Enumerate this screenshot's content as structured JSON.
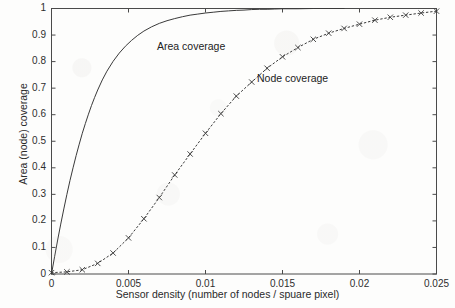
{
  "chart_data": {
    "type": "line",
    "title": "",
    "xlabel": "Sensor density (number of nodes / spuare pixel)",
    "ylabel": "Area (node) coverage",
    "xlim": [
      0,
      0.025
    ],
    "ylim": [
      0,
      1
    ],
    "grid": false,
    "legend_position": "inline-annotations",
    "xticks": [
      0,
      0.005,
      0.01,
      0.015,
      0.02,
      0.025
    ],
    "xtick_labels": [
      "0",
      "0.005",
      "0.01",
      "0.015",
      "0.02",
      "0.025"
    ],
    "yticks": [
      0,
      0.1,
      0.2,
      0.3,
      0.4,
      0.5,
      0.6,
      0.7,
      0.8,
      0.9,
      1
    ],
    "ytick_labels": [
      "0",
      "0.1",
      "0.2",
      "0.3",
      "0.4",
      "0.5",
      "0.6",
      "0.7",
      "0.8",
      "0.9",
      "1"
    ],
    "annotations": [
      {
        "text": "Area coverage",
        "x": 0.0068,
        "y": 0.845
      },
      {
        "text": "Node coverage",
        "x": 0.0133,
        "y": 0.735
      }
    ],
    "series": [
      {
        "name": "Area coverage",
        "style": "solid",
        "marker": "none",
        "color": "#3a3a3a",
        "x": [
          0,
          0.0002,
          0.0004,
          0.0006,
          0.0008,
          0.001,
          0.0012,
          0.0014,
          0.0016,
          0.0018,
          0.002,
          0.0022,
          0.0024,
          0.0026,
          0.0028,
          0.003,
          0.0033,
          0.0036,
          0.004,
          0.0044,
          0.0048,
          0.0052,
          0.0056,
          0.006,
          0.0065,
          0.007,
          0.0075,
          0.008,
          0.0085,
          0.009,
          0.0095,
          0.01,
          0.0105,
          0.011,
          0.0115,
          0.012,
          0.0125,
          0.013,
          0.0135,
          0.014,
          0.0145,
          0.015,
          0.016,
          0.017,
          0.018,
          0.019
        ],
        "y": [
          0,
          0.065,
          0.128,
          0.188,
          0.245,
          0.3,
          0.352,
          0.4,
          0.446,
          0.489,
          0.53,
          0.567,
          0.602,
          0.635,
          0.665,
          0.693,
          0.731,
          0.764,
          0.801,
          0.832,
          0.858,
          0.88,
          0.899,
          0.915,
          0.931,
          0.944,
          0.954,
          0.962,
          0.969,
          0.975,
          0.979,
          0.983,
          0.986,
          0.989,
          0.991,
          0.993,
          0.994,
          0.996,
          0.997,
          0.997,
          0.998,
          0.999,
          0.999,
          1.0,
          1.0,
          1.0
        ]
      },
      {
        "name": "Node coverage",
        "style": "dotted",
        "marker": "x",
        "color": "#3a3a3a",
        "x": [
          0,
          0.001,
          0.002,
          0.003,
          0.004,
          0.005,
          0.006,
          0.007,
          0.008,
          0.009,
          0.01,
          0.011,
          0.012,
          0.013,
          0.014,
          0.015,
          0.016,
          0.017,
          0.018,
          0.019,
          0.02,
          0.021,
          0.022,
          0.023,
          0.024,
          0.025
        ],
        "y": [
          0.005,
          0.008,
          0.016,
          0.04,
          0.079,
          0.136,
          0.208,
          0.288,
          0.373,
          0.452,
          0.53,
          0.604,
          0.67,
          0.723,
          0.775,
          0.818,
          0.853,
          0.884,
          0.907,
          0.925,
          0.941,
          0.956,
          0.967,
          0.975,
          0.983,
          0.99
        ]
      }
    ]
  },
  "axes": {
    "box_color": "#4a4a4a"
  }
}
